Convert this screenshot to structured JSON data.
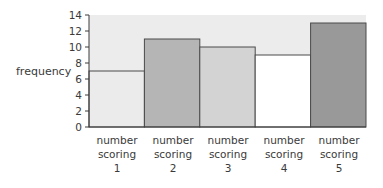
{
  "chart_data": {
    "type": "bar",
    "title": "",
    "xlabel": "",
    "ylabel": "frequency",
    "ylim": [
      0,
      14
    ],
    "yticks": [
      0,
      2,
      4,
      6,
      8,
      10,
      12,
      14
    ],
    "grid": false,
    "legend": null,
    "categories": [
      "number scoring 1",
      "number scoring 2",
      "number scoring 3",
      "number scoring 4",
      "number scoring 5"
    ],
    "values": [
      7,
      11,
      10,
      9,
      13
    ],
    "bar_colors": [
      "#ebebeb",
      "#b5b5b5",
      "#d3d3d3",
      "#ffffff",
      "#999999"
    ],
    "plot_background": "#ececec"
  },
  "labels": {
    "ylabel": "frequency",
    "x": [
      {
        "l1": "number",
        "l2": "scoring",
        "l3": "1"
      },
      {
        "l1": "number",
        "l2": "scoring",
        "l3": "2"
      },
      {
        "l1": "number",
        "l2": "scoring",
        "l3": "3"
      },
      {
        "l1": "number",
        "l2": "scoring",
        "l3": "4"
      },
      {
        "l1": "number",
        "l2": "scoring",
        "l3": "5"
      }
    ]
  }
}
